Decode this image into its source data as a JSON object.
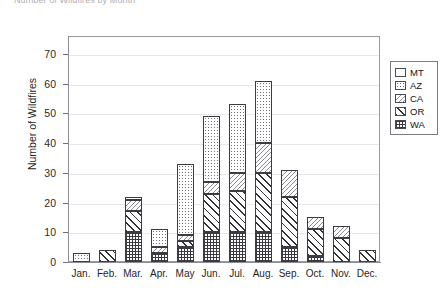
{
  "chart_title": "Number of Wildfires by Month",
  "legend": {
    "position": "top-right",
    "entries": [
      {
        "label": "MT",
        "pattern": "blank-white"
      },
      {
        "label": "AZ",
        "pattern": "dotted"
      },
      {
        "label": "CA",
        "pattern": "fine-diagonal-hatch"
      },
      {
        "label": "OR",
        "pattern": "bold-diagonal-hatch"
      },
      {
        "label": "WA",
        "pattern": "crosshatch-grid"
      }
    ]
  },
  "axes": {
    "y_title": "Number of Wildfires",
    "y_ticks": [
      "0",
      "10",
      "20",
      "30",
      "40",
      "50",
      "60",
      "70"
    ],
    "x_ticks": [
      "Jan.",
      "Feb.",
      "Mar.",
      "Apr.",
      "May",
      "Jun.",
      "Jul.",
      "Aug.",
      "Sep.",
      "Oct.",
      "Nov.",
      "Dec."
    ]
  },
  "chart_data": {
    "type": "bar",
    "subtype": "stacked",
    "title": "Number of Wildfires by Month",
    "xlabel": "",
    "ylabel": "Number of Wildfires",
    "ylim": [
      0,
      76
    ],
    "ytick_step": 10,
    "grid": true,
    "grid_axis": "y",
    "legend_position": "top-right",
    "stack_order_bottom_to_top": [
      "WA",
      "OR",
      "CA",
      "AZ",
      "MT"
    ],
    "categories": [
      "Jan.",
      "Feb.",
      "Mar.",
      "Apr.",
      "May",
      "Jun.",
      "Jul.",
      "Aug.",
      "Sep.",
      "Oct.",
      "Nov.",
      "Dec."
    ],
    "series": [
      {
        "name": "WA",
        "values": [
          0,
          0,
          10,
          3,
          5,
          10,
          10,
          10,
          5,
          2,
          0,
          0
        ]
      },
      {
        "name": "OR",
        "values": [
          0,
          4,
          7,
          0,
          2,
          13,
          14,
          20,
          17,
          9,
          8,
          4
        ]
      },
      {
        "name": "CA",
        "values": [
          0,
          0,
          4,
          2,
          2,
          4,
          6,
          10,
          9,
          4,
          4,
          0
        ]
      },
      {
        "name": "AZ",
        "values": [
          3,
          0,
          1,
          6,
          24,
          22,
          23,
          21,
          0,
          0,
          0,
          0
        ]
      },
      {
        "name": "MT",
        "values": [
          0,
          0,
          0,
          0,
          0,
          0,
          0,
          0,
          0,
          0,
          0,
          0
        ]
      }
    ],
    "totals": [
      3,
      4,
      22,
      11,
      33,
      49,
      53,
      61,
      31,
      15,
      12,
      4
    ]
  },
  "colors": {
    "frame": "#9a9aa2",
    "grid": "#e7e7ec",
    "bar_outline": "#3b3b40",
    "text": "#1a1a1a",
    "background": "#ffffff"
  }
}
